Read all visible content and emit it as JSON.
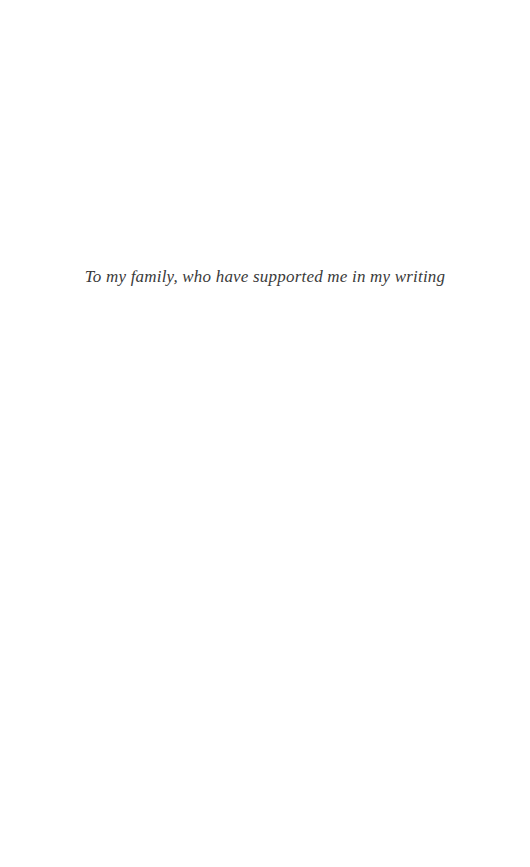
{
  "page": {
    "type": "book-dedication-page",
    "background_color": "#ffffff",
    "text_color": "#3a3a3a",
    "dedication": "To my family, who have supported me in my writing"
  }
}
